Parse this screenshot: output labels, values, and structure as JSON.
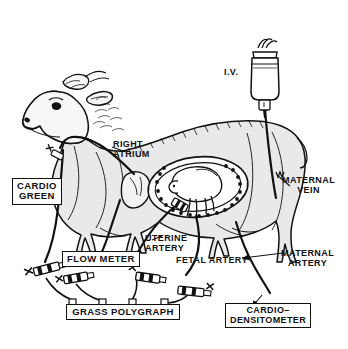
{
  "figure": {
    "background_color": "#ffffff",
    "ink_color": "#111111",
    "body_fill_color": "#e9e9e9"
  },
  "labels": {
    "cardio_green": "CARDIO\nGREEN",
    "flow_meter": "FLOW METER",
    "grass_polygraph": "GRASS POLYGRAPH",
    "cardio_densitometer": "CARDIO–\nDENSITOMETER",
    "right_atrium": "RIGHT\nATRIUM",
    "uterine_artery": "UTERINE\nARTERY",
    "fetal_artery": "FETAL ARTERY",
    "maternal_vein": "MATERNAL\nVEIN",
    "maternal_artery": "MATERNAL\nARTERY",
    "iv": "I.V."
  },
  "equipment": [
    {
      "name": "cardio-green-injectate",
      "label": "CARDIO GREEN",
      "boxed": true
    },
    {
      "name": "flow-meter",
      "label": "FLOW METER",
      "boxed": true
    },
    {
      "name": "grass-polygraph",
      "label": "GRASS POLYGRAPH",
      "boxed": true,
      "channels": 4
    },
    {
      "name": "cardio-densitometer",
      "label": "CARDIO-DENSITOMETER",
      "boxed": true
    },
    {
      "name": "iv-bottle",
      "label": "I.V.",
      "boxed": false
    }
  ],
  "anatomy": [
    {
      "name": "right-atrium",
      "label": "RIGHT ATRIUM"
    },
    {
      "name": "uterine-artery",
      "label": "UTERINE ARTERY"
    },
    {
      "name": "fetal-artery",
      "label": "FETAL ARTERY"
    },
    {
      "name": "maternal-vein",
      "label": "MATERNAL VEIN"
    },
    {
      "name": "maternal-artery",
      "label": "MATERNAL ARTERY"
    }
  ],
  "counts": {
    "polygraph_connectors": 4,
    "inline_transducers": 4,
    "cotyledon_beads": 26
  }
}
